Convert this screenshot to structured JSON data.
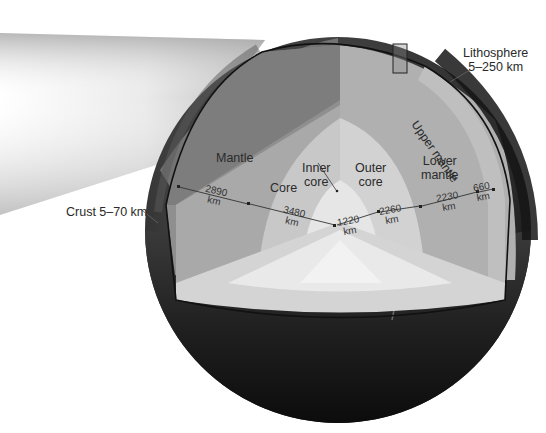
{
  "figure": {
    "colors": {
      "background": "#ffffff",
      "globe_surface_dark": "#1e1e1e",
      "crust_band": "#8a8a8a",
      "mantle_upper_shaded": "#7d7d7d",
      "mantle_face": "#a8a8a8",
      "upper_mantle_band": "#b9b9b9",
      "outer_core": "#cfcfcf",
      "inner_core": "#e4e4e4",
      "floor_face": "#d6d6d6",
      "text": "#2a2a2a"
    }
  },
  "labels": {
    "lithosphere": {
      "name": "Lithosphere",
      "range": "5–250 km"
    },
    "upper_mantle": "Upper mantle",
    "mantle": "Mantle",
    "core": "Core",
    "inner_core": {
      "line1": "Inner",
      "line2": "core"
    },
    "outer_core": {
      "line1": "Outer",
      "line2": "core"
    },
    "lower_mantle": {
      "line1": "Lower",
      "line2": "mantle"
    },
    "crust": "Crust 5–70 km"
  },
  "dimensions": [
    {
      "id": "mantle_thickness",
      "value": "2890",
      "unit": "km"
    },
    {
      "id": "core_radius",
      "value": "3480",
      "unit": "km"
    },
    {
      "id": "inner_core_radius",
      "value": "1220",
      "unit": "km"
    },
    {
      "id": "outer_core_thickness",
      "value": "2260",
      "unit": "km"
    },
    {
      "id": "lower_mantle_thickness",
      "value": "2230",
      "unit": "km"
    },
    {
      "id": "upper_mantle_thickness",
      "value": "660",
      "unit": "km"
    }
  ]
}
